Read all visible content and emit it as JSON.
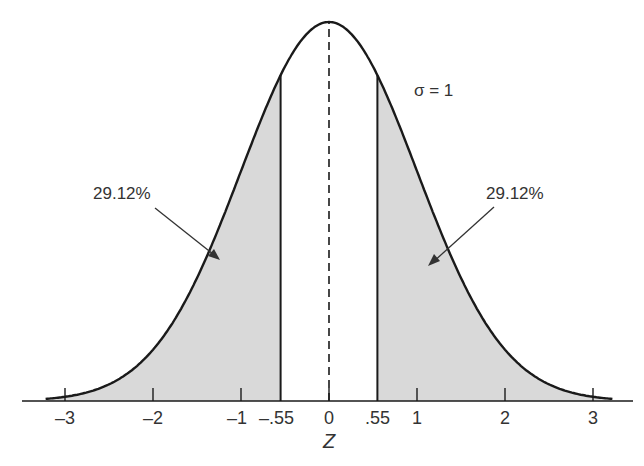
{
  "chart_data": {
    "type": "area",
    "title": "",
    "xlabel": "Z",
    "ylabel": "",
    "distribution": "standard normal",
    "sigma_label": "σ = 1",
    "mean": 0,
    "sd": 1,
    "xlim": [
      -3.2,
      3.2
    ],
    "x_ticks": [
      -3,
      -2,
      -1,
      -0.55,
      0,
      0.55,
      1,
      2,
      3
    ],
    "x_tick_labels": [
      "–3",
      "–2",
      "–1",
      "–.55",
      "0",
      ".55",
      "1",
      "2",
      "3"
    ],
    "grid": false,
    "legend": "none",
    "shaded_regions": [
      {
        "from": -3.2,
        "to": -0.55,
        "label": "29.12%",
        "area_percent": 29.12,
        "fill": "#d9d9d9"
      },
      {
        "from": 0.55,
        "to": 3.2,
        "label": "29.12%",
        "area_percent": 29.12,
        "fill": "#d9d9d9"
      }
    ],
    "unshaded_region": {
      "from": -0.55,
      "to": 0.55
    },
    "center_line": {
      "x": 0,
      "style": "dashed"
    },
    "annotations": [
      {
        "text": "29.12%",
        "side": "left",
        "arrow_to": "left tail region"
      },
      {
        "text": "29.12%",
        "side": "right",
        "arrow_to": "right tail region"
      },
      {
        "text": "σ = 1",
        "position": "upper right of peak"
      }
    ]
  },
  "labels": {
    "left_pct": "29.12%",
    "right_pct": "29.12%",
    "sigma": "σ = 1",
    "axis": "Z",
    "ticks": [
      "–3",
      "–2",
      "–1",
      "–.55",
      "0",
      ".55",
      "1",
      "2",
      "3"
    ]
  }
}
